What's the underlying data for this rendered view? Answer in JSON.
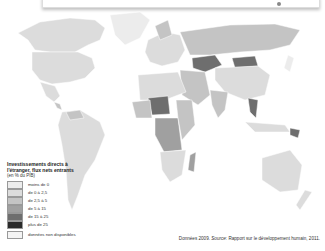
{
  "legend": {
    "title": "Investissements directs à l'étranger, flux nets entrants",
    "subtitle": "(en % du PIB)",
    "items": [
      {
        "label": "moins de 0",
        "color": "#ececec"
      },
      {
        "label": "de 0 à 2,5",
        "color": "#dcdcdc"
      },
      {
        "label": "de 2,5 à 5",
        "color": "#c4c4c4"
      },
      {
        "label": "de 5 à 15",
        "color": "#a0a0a0"
      },
      {
        "label": "de 15 à 25",
        "color": "#6e6e6e"
      },
      {
        "label": "plus de 25",
        "color": "#2a2a2a"
      },
      {
        "label": "données non disponibles",
        "color": "#f4f4f4"
      }
    ]
  },
  "source": {
    "prefix": "Données 2009.",
    "label": "Source",
    "text": ": Rapport sur le développement humain, 2011."
  }
}
